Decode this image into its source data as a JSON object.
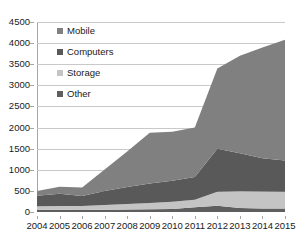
{
  "chart_data": {
    "type": "area",
    "stacked": true,
    "title": "",
    "subtitle": "",
    "xlabel": "",
    "ylabel": "",
    "categories": [
      "2004",
      "2005",
      "2006",
      "2007",
      "2008",
      "2009",
      "2010",
      "2011",
      "2012",
      "2013",
      "2014",
      "2015"
    ],
    "series": [
      {
        "name": "Other",
        "color": "#5e5e5e",
        "values": [
          55,
          55,
          50,
          55,
          60,
          65,
          70,
          110,
          150,
          95,
          85,
          80
        ]
      },
      {
        "name": "Storage",
        "color": "#c4c4c4",
        "values": [
          80,
          85,
          90,
          110,
          130,
          150,
          170,
          180,
          330,
          395,
          400,
          400
        ]
      },
      {
        "name": "Computers",
        "color": "#595959",
        "values": [
          250,
          290,
          240,
          330,
          400,
          460,
          500,
          540,
          1020,
          900,
          790,
          740
        ]
      },
      {
        "name": "Mobile",
        "color": "#808080",
        "values": [
          110,
          170,
          200,
          510,
          840,
          1200,
          1160,
          1170,
          1900,
          2310,
          2620,
          2860
        ]
      }
    ],
    "cumulative_totals": [
      495,
      600,
      580,
      1005,
      1430,
      1875,
      1900,
      2000,
      3400,
      3700,
      3895,
      4080
    ],
    "ylim": [
      0,
      4500
    ],
    "yticks": [
      0,
      500,
      1000,
      1500,
      2000,
      2500,
      3000,
      3500,
      4000,
      4500
    ],
    "grid": true,
    "legend_position": "inside-top-left",
    "legend": [
      {
        "label": "Mobile",
        "swatch": "#808080"
      },
      {
        "label": "Computers",
        "swatch": "#595959"
      },
      {
        "label": "Storage",
        "swatch": "#c4c4c4"
      },
      {
        "label": "Other",
        "swatch": "#5e5e5e"
      }
    ]
  },
  "colors": {
    "axis": "#a6a6a6",
    "grid": "#c9c9c9",
    "text": "#1a1a1a",
    "background": "#ffffff"
  }
}
